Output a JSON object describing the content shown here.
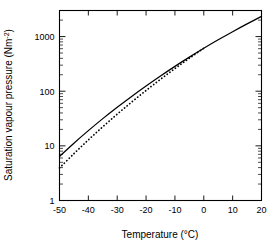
{
  "chart_data": {
    "type": "line",
    "title": "",
    "xlabel": "Temperature (°C)",
    "ylabel": "Saturation vapour pressure (Nm⁻²)",
    "xlim": [
      -50,
      20
    ],
    "ylim": [
      1,
      3000
    ],
    "yscale": "log",
    "xscale": "linear",
    "grid": false,
    "legend": "none",
    "xticks": [
      -50,
      -40,
      -30,
      -20,
      -10,
      0,
      10,
      20
    ],
    "xticklabels": [
      "-50",
      "-40",
      "-30",
      "-20",
      "-10",
      "0",
      "10",
      "20"
    ],
    "yticks": [
      1,
      10,
      100,
      1000
    ],
    "yticklabels": [
      "1",
      "10",
      "100",
      "1000"
    ],
    "y_minor_ticks": true,
    "series": [
      {
        "name": "saturation vapour pressure over water",
        "style": "solid",
        "x": [
          -50,
          -45,
          -40,
          -35,
          -30,
          -25,
          -20,
          -15,
          -10,
          -5,
          0,
          5,
          10,
          15,
          20
        ],
        "values": [
          6.4,
          11.2,
          19.0,
          31.5,
          50.9,
          80.4,
          124.5,
          189.9,
          285.0,
          420.9,
          611.2,
          872.5,
          1228.1,
          1705.6,
          2339.3
        ]
      },
      {
        "name": "saturation vapour pressure over ice",
        "style": "dotted",
        "x": [
          -50,
          -45,
          -40,
          -35,
          -30,
          -25,
          -20,
          -15,
          -10,
          -5,
          0
        ],
        "values": [
          3.94,
          7.2,
          12.85,
          22.35,
          38.01,
          63.29,
          103.2,
          165.3,
          259.9,
          401.7,
          611.2
        ]
      }
    ]
  },
  "axis_labels": {
    "x_title": "Temperature (°C)",
    "y_title": "Saturation vapour pressure (Nm⁻²)",
    "y_title_main": "Saturation vapour pressure (Nm",
    "y_title_sup": "-2",
    "y_title_tail": ")"
  },
  "colors": {
    "foreground": "#000000",
    "background": "#ffffff"
  }
}
